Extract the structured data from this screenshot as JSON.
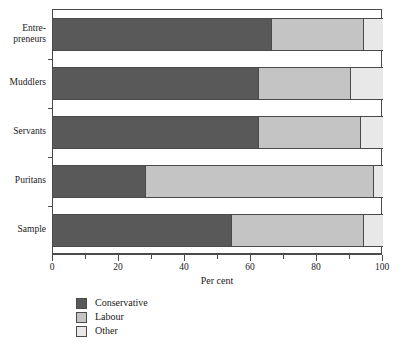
{
  "chart_data": {
    "type": "bar",
    "orientation": "horizontal",
    "stacked": true,
    "title": "",
    "xlabel": "Per cent",
    "ylabel": "",
    "xlim": [
      0,
      100
    ],
    "xticks": [
      0,
      20,
      40,
      60,
      80,
      100
    ],
    "xtick_labels": [
      "0",
      "20",
      "40",
      "60",
      "80",
      "100"
    ],
    "xminorticks": [
      10,
      30,
      50,
      70,
      90
    ],
    "grid": false,
    "legend_position": "below-axis-left",
    "categories": [
      "Entre-\npreneurs",
      "Muddlers",
      "Servants",
      "Puritans",
      "Sample"
    ],
    "series": [
      {
        "name": "Conservative",
        "color": "#595959",
        "values": [
          66,
          62,
          62,
          28,
          54
        ]
      },
      {
        "name": "Labour",
        "color": "#c4c4c4",
        "values": [
          28,
          28,
          31,
          69,
          40
        ]
      },
      {
        "name": "Other",
        "color": "#e8e8e8",
        "values": [
          6,
          10,
          7,
          3,
          6
        ]
      }
    ],
    "cumulative_boundaries": [
      [
        66,
        94
      ],
      [
        62,
        90
      ],
      [
        62,
        93
      ],
      [
        28,
        97
      ],
      [
        54,
        94
      ]
    ]
  },
  "legend": {
    "items": [
      {
        "label": "Conservative",
        "color": "#595959"
      },
      {
        "label": "Labour",
        "color": "#c4c4c4"
      },
      {
        "label": "Other",
        "color": "#e8e8e8"
      }
    ]
  },
  "axis": {
    "x_title": "Per cent"
  }
}
